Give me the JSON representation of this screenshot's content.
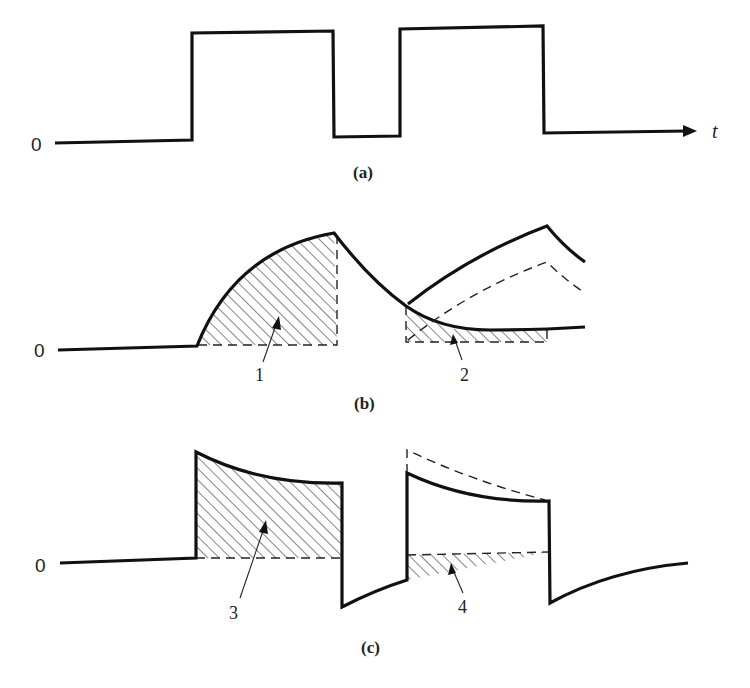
{
  "figure": {
    "panels": [
      {
        "id": "a",
        "caption": "(a)",
        "description": "Rectangular input pulse train vs time",
        "zero_label": "0",
        "axis_label": "t"
      },
      {
        "id": "b",
        "caption": "(b)",
        "description": "Exponential rise and decay response with shaded areas",
        "zero_label": "0",
        "area_labels": [
          "1",
          "2"
        ]
      },
      {
        "id": "c",
        "caption": "(c)",
        "description": "Derivative-like response with overshoot spikes and shaded areas",
        "zero_label": "0",
        "area_labels": [
          "3",
          "4"
        ]
      }
    ],
    "colors": {
      "stroke": "#111111",
      "background": "#ffffff"
    }
  }
}
